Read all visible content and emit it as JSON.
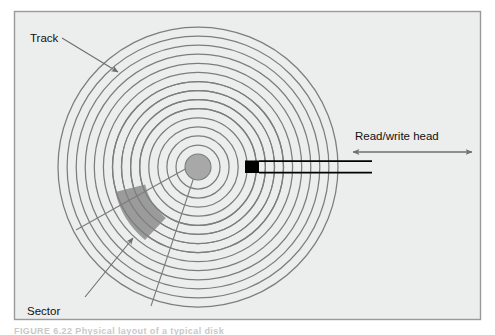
{
  "figure": {
    "caption": "FIGURE  6.22   Physical layout of a typical disk",
    "frame": {
      "x": 14,
      "y": 11,
      "width": 467,
      "height": 309,
      "fill": "#eceded",
      "border_color": "#9a9a9a"
    }
  },
  "labels": {
    "track": "Track",
    "sector": "Sector",
    "read_write_head": "Read/write head"
  },
  "colors": {
    "background": "#ffffff",
    "panel": "#eceded",
    "track_line": "#7d7d7d",
    "hub_fill": "#a8a8a8",
    "sector_fill": "#9b9b9b",
    "head_block": "#000000",
    "arm_line": "#000000",
    "leader_line": "#6e6e6e",
    "text": "#111111"
  },
  "diagram": {
    "type": "disk-platter-schematic",
    "center": {
      "x": 198,
      "y": 167
    },
    "track_count": 14,
    "outer_radius": 140,
    "inner_track_radius": 22,
    "hub_radius": 13,
    "sector": {
      "start_angle_deg": 196,
      "end_angle_deg": 232,
      "inner_radius": 60,
      "outer_radius": 86
    },
    "head": {
      "block_x": 245,
      "block_y": 161,
      "block_width": 14,
      "block_height": 12,
      "arm_start_x": 259,
      "arm_end_x": 372,
      "arm_top_y": 161,
      "arm_bottom_y": 173
    },
    "head_travel_arrow": {
      "x1": 353,
      "x2": 472,
      "y": 152
    },
    "leaders": [
      {
        "name": "track-leader",
        "x1": 62,
        "x2": 119,
        "y1": 39,
        "y2": 73
      },
      {
        "name": "sector-leader",
        "x1": 85,
        "x2": 134,
        "y1": 297,
        "y2": 237
      },
      {
        "name": "sector-radius-a",
        "x1": 76,
        "x2": 196,
        "y1": 230,
        "y2": 163
      },
      {
        "name": "sector-radius-b",
        "x1": 151,
        "x2": 197,
        "y1": 305,
        "y2": 168
      }
    ]
  },
  "label_positions": {
    "track": {
      "x": 30,
      "y": 41
    },
    "sector": {
      "x": 27,
      "y": 312
    },
    "read_write_head": {
      "x": 356,
      "y": 140
    }
  }
}
